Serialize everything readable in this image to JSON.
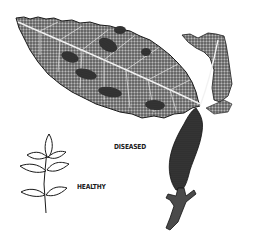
{
  "figure": {
    "labels": {
      "diseased": "DISEASED",
      "healthy": "HEALTHY"
    },
    "subjects": [
      {
        "name": "diseased-shoot",
        "description": "Large serrated leaf with dark blotchy lesions, stem with swollen darkened gall and twig"
      },
      {
        "name": "healthy-compound-leaf",
        "description": "Small line drawing of pinnate compound leaf with seven leaflets"
      }
    ],
    "colors": {
      "background": "#ffffff",
      "ink": "#1a1a1a",
      "leaf_tone": "#6b6b6b",
      "lesion": "#2a2a2a"
    }
  }
}
